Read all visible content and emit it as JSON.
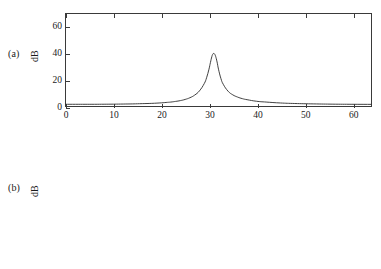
{
  "figure": {
    "background": "#ffffff",
    "line_color": "#2b2b2b",
    "axis_color": "#3a3a3a"
  },
  "panels": [
    {
      "tag": "(a)",
      "ylabel": "dB",
      "xlabel": "",
      "y_ticks": [
        "0",
        "20",
        "40",
        "60"
      ],
      "x_ticks": [
        "0",
        "10",
        "20",
        "30",
        "40",
        "50",
        "60"
      ]
    },
    {
      "tag": "(b)",
      "ylabel": "dB",
      "xlabel": "Frequency, Hz",
      "y_ticks": [
        "0",
        "20",
        "40",
        "60"
      ],
      "x_ticks": [
        "0",
        "10",
        "20",
        "30",
        "40",
        "50",
        "60"
      ]
    }
  ],
  "chart_data": [
    {
      "type": "line",
      "title": "",
      "panel_label": "(a)",
      "xlabel": "Frequency, Hz",
      "ylabel": "dB",
      "xlim": [
        0,
        64
      ],
      "ylim": [
        0,
        70
      ],
      "xticks": [
        0,
        10,
        20,
        30,
        40,
        50,
        60
      ],
      "yticks": [
        0,
        20,
        40,
        60
      ],
      "grid": false,
      "legend": "none",
      "description": "Sharp narrowband resonance peak near 31 Hz reaching about 40 dB, with broad low-level tails over a noise floor near 1 dB.",
      "peak": {
        "frequency_hz": 31,
        "amplitude_db": 40
      },
      "baseline_db": 1,
      "series": [
        {
          "name": "spectrum-a",
          "x": [
            0,
            2,
            4,
            6,
            8,
            10,
            12,
            14,
            16,
            18,
            20,
            21,
            22,
            23,
            24,
            25,
            26,
            27,
            28,
            29,
            29.5,
            30,
            30.3,
            30.6,
            30.8,
            31,
            31.2,
            31.4,
            31.7,
            32,
            32.5,
            33,
            34,
            35,
            36,
            37,
            38,
            40,
            42,
            45,
            48,
            52,
            56,
            60,
            64
          ],
          "y": [
            1.3,
            1.3,
            1.3,
            1.3,
            1.35,
            1.4,
            1.5,
            1.6,
            1.8,
            2.0,
            2.4,
            2.7,
            3.0,
            3.5,
            4.1,
            5.0,
            6.3,
            8.3,
            11.5,
            17.0,
            21.5,
            28.0,
            33.0,
            37.5,
            39.4,
            40.0,
            39.4,
            37.8,
            33.5,
            28.0,
            21.0,
            16.5,
            11.3,
            8.5,
            6.8,
            5.6,
            4.8,
            3.6,
            3.0,
            2.3,
            1.9,
            1.6,
            1.4,
            1.3,
            1.25
          ]
        }
      ]
    },
    {
      "type": "line",
      "title": "",
      "panel_label": "(b)",
      "xlabel": "Frequency, Hz",
      "ylabel": "dB",
      "xlim": [
        0,
        64
      ],
      "ylim": [
        0,
        70
      ],
      "xticks": [
        0,
        10,
        20,
        30,
        40,
        50,
        60
      ],
      "yticks": [
        0,
        20,
        40,
        60
      ],
      "grid": false,
      "legend": "none",
      "description": "Single broad smooth bump centred near 31 Hz reaching about 22 dB, flat near-zero baseline elsewhere.",
      "peak": {
        "frequency_hz": 31,
        "amplitude_db": 22
      },
      "baseline_db": 0.2,
      "series": [
        {
          "name": "spectrum-b",
          "x": [
            0,
            5,
            10,
            15,
            20,
            23,
            25,
            26.5,
            27.5,
            28,
            28.5,
            29,
            29.5,
            30,
            30.5,
            31,
            31.5,
            32,
            32.3,
            32.7,
            33,
            33.5,
            34,
            34.5,
            35,
            36,
            38,
            40,
            45,
            50,
            55,
            60,
            64
          ],
          "y": [
            0.2,
            0.2,
            0.2,
            0.25,
            0.3,
            0.4,
            0.6,
            1.1,
            2.6,
            4.5,
            8.0,
            13.0,
            18.0,
            21.2,
            22.0,
            22.1,
            21.6,
            19.0,
            16.5,
            12.0,
            8.5,
            4.5,
            2.2,
            1.1,
            0.6,
            0.3,
            0.22,
            0.2,
            0.2,
            0.2,
            0.2,
            0.2,
            0.2
          ]
        }
      ]
    }
  ]
}
